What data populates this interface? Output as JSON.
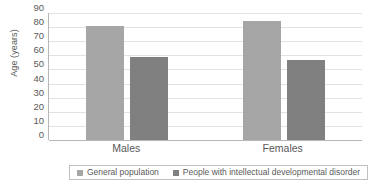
{
  "chart_data": {
    "type": "bar",
    "title": "",
    "xlabel": "",
    "ylabel": "Age (years)",
    "ylim": [
      0,
      90
    ],
    "ytick_step": 10,
    "yticks": [
      90,
      80,
      70,
      60,
      50,
      40,
      30,
      20,
      10,
      0
    ],
    "grid": true,
    "legend_position": "bottom",
    "categories": [
      "Males",
      "Females"
    ],
    "series": [
      {
        "name": "General population",
        "color": "#a6a6a6",
        "values": [
          81,
          84
        ]
      },
      {
        "name": "People with intellectual developmental disorder",
        "color": "#808080",
        "values": [
          59,
          57
        ]
      }
    ]
  },
  "axis": {
    "y_title": "Age (years)"
  },
  "legend": {
    "entries": [
      {
        "label": "General population"
      },
      {
        "label": "People with intellectual developmental disorder"
      }
    ]
  },
  "colors": {
    "series_general_population": "#a6a6a6",
    "series_idd": "#808080",
    "gridline": "#e2e2e2",
    "axis_line": "#b7b7b7",
    "text": "#595959",
    "background": "#ffffff"
  }
}
